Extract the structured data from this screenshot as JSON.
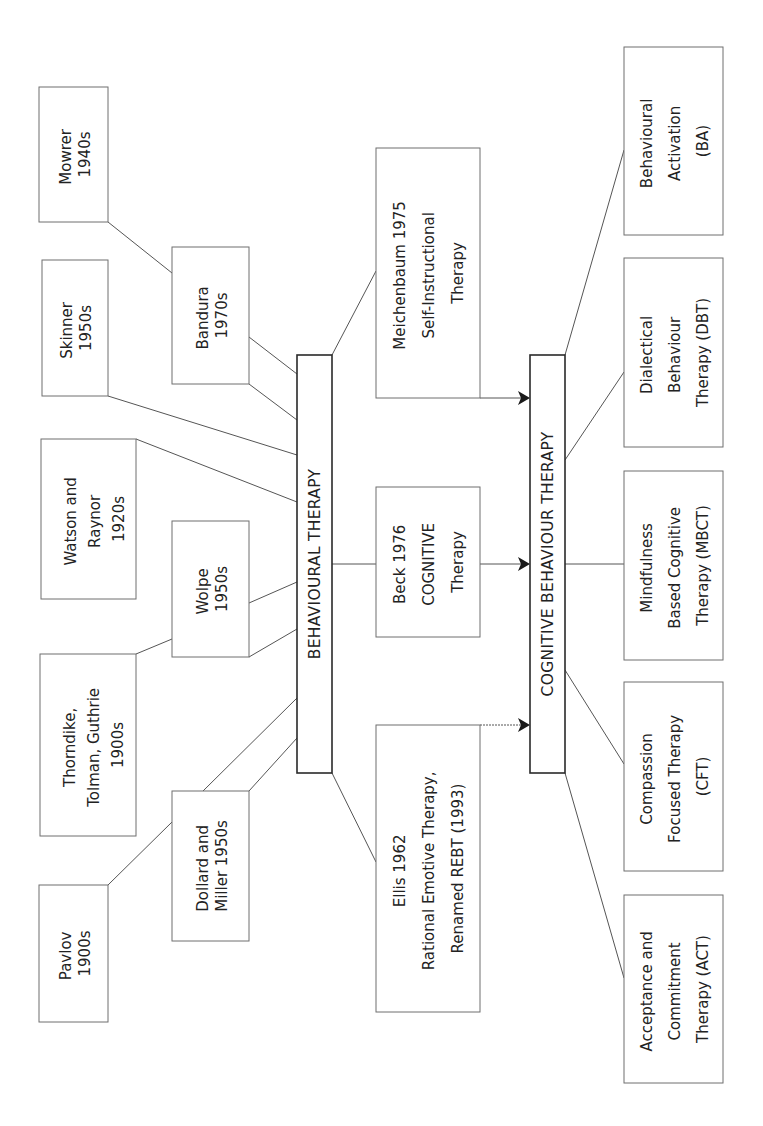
{
  "diagram": {
    "orientation": "rotated 90 degrees counter-clockwise (text reads bottom-to-top)",
    "hubs": {
      "behavioural": {
        "label": "BEHAVIOURAL THERAPY"
      },
      "cbt": {
        "label": "COGNITIVE BEHAVIOUR THERAPY"
      }
    },
    "influences": [
      {
        "id": "mowrer",
        "lines": [
          "Mowrer",
          "1940s"
        ]
      },
      {
        "id": "skinner",
        "lines": [
          "Skinner",
          "1950s"
        ]
      },
      {
        "id": "bandura",
        "lines": [
          "Bandura",
          "1970s"
        ]
      },
      {
        "id": "watson",
        "lines": [
          "Watson and",
          "Raynor",
          "1920s"
        ]
      },
      {
        "id": "wolpe",
        "lines": [
          "Wolpe",
          "1950s"
        ]
      },
      {
        "id": "thorndike",
        "lines": [
          "Thorndike,",
          "Tolman, Guthrie",
          "1900s"
        ]
      },
      {
        "id": "dollard",
        "lines": [
          "Dollard and",
          "Miller 1950s"
        ]
      },
      {
        "id": "pavlov",
        "lines": [
          "Pavlov",
          "1900s"
        ]
      }
    ],
    "cognitive_contributors": [
      {
        "id": "meichenbaum",
        "lines": [
          "Meichenbaum 1975",
          "Self-Instructional",
          "Therapy"
        ]
      },
      {
        "id": "beck",
        "lines": [
          "Beck 1976",
          "COGNITIVE",
          "Therapy"
        ]
      },
      {
        "id": "ellis",
        "lines": [
          "Ellis 1962",
          "Rational Emotive Therapy,",
          "Renamed REBT (1993)"
        ]
      }
    ],
    "third_wave": [
      {
        "id": "ba",
        "lines": [
          "Behavioural",
          "Activation",
          "(BA)"
        ]
      },
      {
        "id": "dbt",
        "lines": [
          "Dialectical",
          "Behaviour",
          "Therapy (DBT)"
        ]
      },
      {
        "id": "mbct",
        "lines": [
          "Mindfulness",
          "Based Cognitive",
          "Therapy (MBCT)"
        ]
      },
      {
        "id": "cft",
        "lines": [
          "Compassion",
          "Focused Therapy",
          "(CFT)"
        ]
      },
      {
        "id": "act",
        "lines": [
          "Acceptance and",
          "Commitment",
          "Therapy (ACT)"
        ]
      }
    ],
    "colors": {
      "background": "#ffffff",
      "box_stroke": "#6f6f6f",
      "hub_stroke": "#2a2a2a",
      "text": "#222222",
      "arrow": "#1a1a1a"
    }
  }
}
